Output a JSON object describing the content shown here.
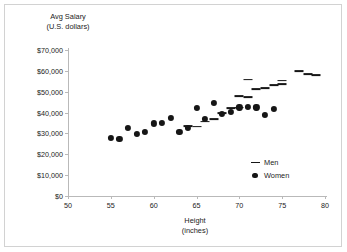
{
  "chart_data": {
    "type": "scatter",
    "title": "",
    "xlabel": "Height",
    "xlabel_sub": "(inches)",
    "ylabel": "Avg Salary",
    "ylabel_sub": "(U.S. dollars)",
    "xlim": [
      50,
      80
    ],
    "ylim": [
      0,
      70000
    ],
    "xticks": [
      50,
      55,
      60,
      65,
      70,
      75,
      80
    ],
    "xtick_labels": [
      "50",
      "55",
      "60",
      "65",
      "70",
      "75",
      "80"
    ],
    "yticks": [
      0,
      10000,
      20000,
      30000,
      40000,
      50000,
      60000,
      70000
    ],
    "ytick_labels": [
      "$0",
      "$10,000",
      "$20,000",
      "$30,000",
      "$40,000",
      "$50,000",
      "$60,000",
      "$70,000"
    ],
    "grid": false,
    "legend_position": "inside-bottom-right",
    "series": [
      {
        "name": "Men",
        "marker": "dash",
        "color": "#161616",
        "points": [
          {
            "x": 64,
            "y": 33500
          },
          {
            "x": 65,
            "y": 33300
          },
          {
            "x": 66,
            "y": 35700
          },
          {
            "x": 67,
            "y": 36700
          },
          {
            "x": 68,
            "y": 39700
          },
          {
            "x": 69,
            "y": 42300
          },
          {
            "x": 70,
            "y": 42400
          },
          {
            "x": 70,
            "y": 47800
          },
          {
            "x": 71,
            "y": 47300
          },
          {
            "x": 71,
            "y": 55800
          },
          {
            "x": 72,
            "y": 51400
          },
          {
            "x": 73,
            "y": 51800
          },
          {
            "x": 74,
            "y": 53000
          },
          {
            "x": 75,
            "y": 55300
          },
          {
            "x": 75,
            "y": 53700
          },
          {
            "x": 77,
            "y": 59700
          },
          {
            "x": 78,
            "y": 58400
          },
          {
            "x": 79,
            "y": 58100
          }
        ]
      },
      {
        "name": "Women",
        "marker": "circle",
        "color": "#161616",
        "points": [
          {
            "x": 55,
            "y": 28000
          },
          {
            "x": 56,
            "y": 27300
          },
          {
            "x": 57,
            "y": 32800
          },
          {
            "x": 58,
            "y": 29800
          },
          {
            "x": 59,
            "y": 30900
          },
          {
            "x": 60,
            "y": 34800
          },
          {
            "x": 61,
            "y": 35000
          },
          {
            "x": 62,
            "y": 37500
          },
          {
            "x": 63,
            "y": 30700
          },
          {
            "x": 64,
            "y": 32800
          },
          {
            "x": 65,
            "y": 42400
          },
          {
            "x": 66,
            "y": 36800
          },
          {
            "x": 67,
            "y": 44700
          },
          {
            "x": 68,
            "y": 39500
          },
          {
            "x": 69,
            "y": 40400
          },
          {
            "x": 70,
            "y": 42500
          },
          {
            "x": 71,
            "y": 42900
          },
          {
            "x": 72,
            "y": 42500
          },
          {
            "x": 73,
            "y": 38800
          },
          {
            "x": 74,
            "y": 41600
          }
        ]
      }
    ],
    "legend": [
      {
        "label": "Men",
        "marker": "dash"
      },
      {
        "label": "Women",
        "marker": "circle"
      }
    ]
  }
}
